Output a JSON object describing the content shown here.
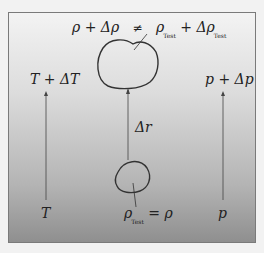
{
  "diagram": {
    "top_equation": {
      "lhs": "ρ + Δρ",
      "relation": "≠",
      "rhs_rho": "ρ",
      "rhs_sub": "Test",
      "rhs_plus": "+ Δρ",
      "rhs_plus_sub": "Test"
    },
    "left_top": "T + ΔT",
    "left_bottom": "T",
    "right_top": "p + Δp",
    "right_bottom": "p",
    "displacement": "Δr",
    "bottom_equation": {
      "rho": "ρ",
      "sub": "Test",
      "rest": "= ρ"
    },
    "colors": {
      "frame": "#7a7a7a",
      "line": "#333333",
      "bg_top": "#f3f3f3",
      "bg_bottom": "#8f8f8f"
    }
  }
}
